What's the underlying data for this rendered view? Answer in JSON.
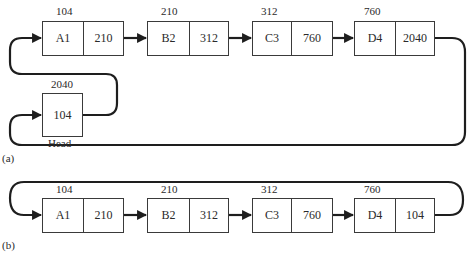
{
  "diagram": {
    "part_a": {
      "caption": "(a)",
      "nodes": [
        {
          "address": "104",
          "data": "A1",
          "next": "210"
        },
        {
          "address": "210",
          "data": "B2",
          "next": "312"
        },
        {
          "address": "312",
          "data": "C3",
          "next": "760"
        },
        {
          "address": "760",
          "data": "D4",
          "next": "2040"
        }
      ],
      "head": {
        "address": "2040",
        "value": "104",
        "label": "Head"
      }
    },
    "part_b": {
      "caption": "(b)",
      "nodes": [
        {
          "address": "104",
          "data": "A1",
          "next": "210"
        },
        {
          "address": "210",
          "data": "B2",
          "next": "312"
        },
        {
          "address": "312",
          "data": "C3",
          "next": "760"
        },
        {
          "address": "760",
          "data": "D4",
          "next": "104"
        }
      ]
    },
    "colors": {
      "line": "#1e1e1e",
      "box_border": "#3a3a3a",
      "text": "#2a2a2a"
    }
  }
}
